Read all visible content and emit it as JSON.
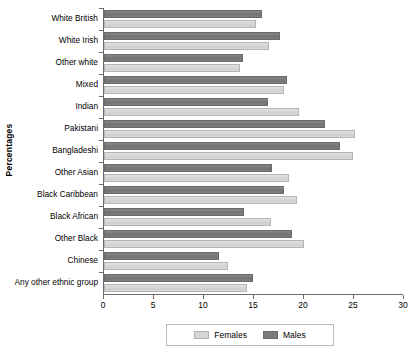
{
  "chart_data": {
    "type": "bar",
    "orientation": "horizontal",
    "title": "",
    "xlabel": "",
    "ylabel": "Percentages",
    "xlim": [
      0,
      30
    ],
    "xticks": [
      0,
      5,
      10,
      15,
      20,
      25,
      30
    ],
    "xtick_labels": [
      "0",
      "5",
      "10",
      "15",
      "20",
      "25",
      "30"
    ],
    "grid": false,
    "legend_position": "bottom",
    "categories": [
      "White British",
      "White Irish",
      "Other white",
      "Mixed",
      "Indian",
      "Pakistani",
      "Bangladeshi",
      "Other Asian",
      "Black Caribbean",
      "Black African",
      "Other Black",
      "Chinese",
      "Any other ethnic group"
    ],
    "series": [
      {
        "name": "Males",
        "color": "#7b7b7b",
        "values": [
          15.8,
          17.6,
          13.9,
          18.3,
          16.4,
          22.1,
          23.6,
          16.8,
          18.0,
          14.0,
          18.8,
          11.5,
          14.9
        ]
      },
      {
        "name": "Females",
        "color": "#d6d6d6",
        "values": [
          15.2,
          16.5,
          13.6,
          18.0,
          19.5,
          25.1,
          24.9,
          18.5,
          19.3,
          16.7,
          20.0,
          12.4,
          14.3
        ]
      }
    ],
    "legend": [
      {
        "label": "Females",
        "swatch": "females"
      },
      {
        "label": "Males",
        "swatch": "males"
      }
    ]
  }
}
